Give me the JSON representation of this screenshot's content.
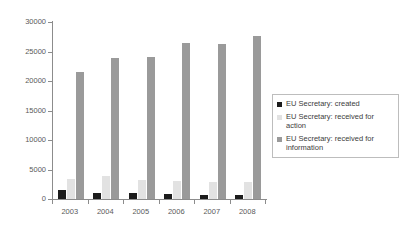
{
  "chart_data": {
    "type": "bar",
    "title": "",
    "xlabel": "",
    "ylabel": "",
    "categories": [
      "2003",
      "2004",
      "2005",
      "2006",
      "2007",
      "2008"
    ],
    "ylim": [
      0,
      30000
    ],
    "yticks": [
      0,
      5000,
      10000,
      15000,
      20000,
      25000,
      30000
    ],
    "ytick_labels": [
      "0",
      "5000",
      "10000",
      "15000",
      "20000",
      "25000",
      "30000"
    ],
    "grid": false,
    "legend_position": "right",
    "series": [
      {
        "name": "EU Secretary: created",
        "color": "#1c1c1c",
        "values": [
          1450,
          1050,
          950,
          800,
          700,
          700
        ]
      },
      {
        "name": "EU Secretary: received for action",
        "color": "#e2e2e2",
        "values": [
          3350,
          3900,
          3150,
          3000,
          2800,
          2900
        ]
      },
      {
        "name": "EU Secretary: received for information",
        "color": "#9a9a9a",
        "values": [
          21600,
          23900,
          24000,
          26500,
          26200,
          27700
        ]
      }
    ]
  }
}
